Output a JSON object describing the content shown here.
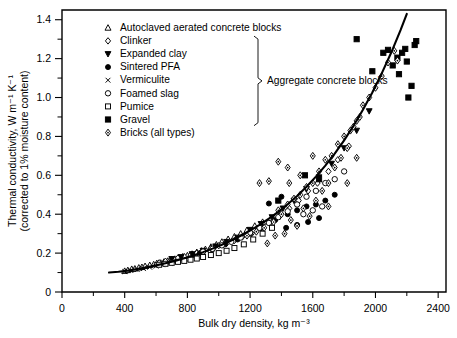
{
  "chart_data": {
    "type": "scatter",
    "title": "",
    "xlabel": "Bulk dry density, kg m⁻³",
    "ylabel": "Thermal conductivity, W m⁻¹ K⁻¹",
    "ylabel_line2": "(corrected to 1% moisture content)",
    "xlim": [
      0,
      2450
    ],
    "ylim": [
      0,
      1.45
    ],
    "x_ticks_major": [
      0,
      400,
      800,
      1200,
      1600,
      2000,
      2400
    ],
    "x_ticks_minor": [
      200,
      600,
      1000,
      1400,
      1800,
      2200
    ],
    "y_ticks_major": [
      0,
      0.2,
      0.4,
      0.6,
      0.8,
      1.0,
      1.2,
      1.4
    ],
    "y_ticks_minor": [
      0.1,
      0.3,
      0.5,
      0.7,
      0.9,
      1.1,
      1.3
    ],
    "x_tick_labels": [
      "0",
      "400",
      "800",
      "1200",
      "1600",
      "2000",
      "2400"
    ],
    "y_tick_labels": [
      "0",
      "0.2",
      "0.4",
      "0.6",
      "0.8",
      "1.0",
      "1.2",
      "1.4"
    ],
    "grid": false,
    "legend_position": "top-left-inside",
    "group_bracket_label": "Aggregate concrete blocks",
    "fit_curve": {
      "name": "best-fit trend line",
      "points": [
        [
          300,
          0.1
        ],
        [
          360,
          0.104
        ],
        [
          420,
          0.11
        ],
        [
          480,
          0.118
        ],
        [
          540,
          0.127
        ],
        [
          600,
          0.137
        ],
        [
          660,
          0.148
        ],
        [
          720,
          0.16
        ],
        [
          780,
          0.174
        ],
        [
          840,
          0.189
        ],
        [
          900,
          0.205
        ],
        [
          960,
          0.223
        ],
        [
          1020,
          0.243
        ],
        [
          1080,
          0.265
        ],
        [
          1140,
          0.289
        ],
        [
          1200,
          0.316
        ],
        [
          1260,
          0.345
        ],
        [
          1320,
          0.377
        ],
        [
          1380,
          0.412
        ],
        [
          1440,
          0.451
        ],
        [
          1500,
          0.494
        ],
        [
          1560,
          0.541
        ],
        [
          1620,
          0.593
        ],
        [
          1680,
          0.65
        ],
        [
          1740,
          0.712
        ],
        [
          1800,
          0.78
        ],
        [
          1860,
          0.855
        ],
        [
          1920,
          0.937
        ],
        [
          1980,
          1.026
        ],
        [
          2040,
          1.124
        ],
        [
          2100,
          1.23
        ],
        [
          2160,
          1.346
        ],
        [
          2200,
          1.43
        ]
      ]
    },
    "series": [
      {
        "name": "Autoclaved aerated concrete blocks",
        "marker": "triangle-open",
        "filled": false,
        "points": [
          [
            400,
            0.108
          ],
          [
            420,
            0.112
          ],
          [
            445,
            0.118
          ],
          [
            465,
            0.12
          ],
          [
            490,
            0.125
          ],
          [
            510,
            0.128
          ],
          [
            530,
            0.133
          ],
          [
            560,
            0.138
          ],
          [
            585,
            0.142
          ],
          [
            605,
            0.148
          ],
          [
            630,
            0.15
          ],
          [
            650,
            0.155
          ],
          [
            675,
            0.16
          ],
          [
            700,
            0.165
          ],
          [
            720,
            0.17
          ],
          [
            745,
            0.175
          ],
          [
            770,
            0.182
          ],
          [
            800,
            0.188
          ],
          [
            830,
            0.196
          ],
          [
            860,
            0.205
          ],
          [
            890,
            0.212
          ],
          [
            915,
            0.22
          ],
          [
            950,
            0.232
          ],
          [
            985,
            0.244
          ],
          [
            1020,
            0.258
          ],
          [
            1060,
            0.272
          ],
          [
            1100,
            0.285
          ],
          [
            1140,
            0.3
          ],
          [
            1180,
            0.318
          ],
          [
            1230,
            0.34
          ],
          [
            1280,
            0.36
          ]
        ]
      },
      {
        "name": "Clinker",
        "marker": "diamond-open",
        "filled": false,
        "points": [
          [
            620,
            0.15
          ],
          [
            660,
            0.158
          ],
          [
            700,
            0.168
          ],
          [
            740,
            0.175
          ],
          [
            780,
            0.182
          ],
          [
            820,
            0.19
          ],
          [
            860,
            0.2
          ],
          [
            900,
            0.21
          ],
          [
            950,
            0.225
          ],
          [
            1000,
            0.238
          ],
          [
            1050,
            0.25
          ],
          [
            1100,
            0.265
          ],
          [
            1150,
            0.283
          ],
          [
            1210,
            0.3
          ],
          [
            1270,
            0.33
          ],
          [
            1330,
            0.355
          ],
          [
            1390,
            0.39
          ],
          [
            1450,
            0.43
          ],
          [
            1510,
            0.47
          ],
          [
            1570,
            0.52
          ],
          [
            1630,
            0.56
          ],
          [
            1700,
            0.62
          ],
          [
            1760,
            0.68
          ],
          [
            1830,
            0.75
          ]
        ]
      },
      {
        "name": "Expanded clay",
        "marker": "triangle-down-filled",
        "filled": true,
        "points": [
          [
            700,
            0.17
          ],
          [
            760,
            0.18
          ],
          [
            830,
            0.195
          ],
          [
            900,
            0.212
          ],
          [
            980,
            0.235
          ],
          [
            1050,
            0.258
          ],
          [
            1120,
            0.28
          ],
          [
            1200,
            0.32
          ],
          [
            1270,
            0.35
          ],
          [
            1340,
            0.385
          ],
          [
            1410,
            0.43
          ],
          [
            1480,
            0.47
          ],
          [
            1560,
            0.53
          ],
          [
            1640,
            0.59
          ],
          [
            1720,
            0.66
          ],
          [
            1800,
            0.74
          ],
          [
            1880,
            0.83
          ],
          [
            1960,
            0.93
          ]
        ]
      },
      {
        "name": "Sintered PFA",
        "marker": "circle-filled",
        "filled": true,
        "points": [
          [
            880,
            0.2
          ],
          [
            960,
            0.22
          ],
          [
            1040,
            0.245
          ],
          [
            1120,
            0.27
          ],
          [
            1200,
            0.3
          ],
          [
            1280,
            0.33
          ],
          [
            1360,
            0.37
          ],
          [
            1440,
            0.4
          ],
          [
            1500,
            0.42
          ],
          [
            1560,
            0.44
          ],
          [
            1620,
            0.45
          ],
          [
            1680,
            0.47
          ],
          [
            1740,
            0.5
          ],
          [
            1430,
            0.33
          ],
          [
            1500,
            0.345
          ],
          [
            1570,
            0.36
          ],
          [
            1640,
            0.38
          ],
          [
            1320,
            0.455
          ],
          [
            1400,
            0.49
          ]
        ]
      },
      {
        "name": "Vermiculite",
        "marker": "x-small",
        "filled": true,
        "points": [
          [
            400,
            0.105
          ],
          [
            440,
            0.11
          ],
          [
            480,
            0.115
          ],
          [
            520,
            0.12
          ],
          [
            560,
            0.127
          ],
          [
            600,
            0.133
          ],
          [
            640,
            0.14
          ],
          [
            690,
            0.148
          ],
          [
            740,
            0.158
          ],
          [
            790,
            0.168
          ],
          [
            840,
            0.18
          ]
        ]
      },
      {
        "name": "Foamed slag",
        "marker": "circle-open",
        "filled": false,
        "points": [
          [
            900,
            0.208
          ],
          [
            960,
            0.222
          ],
          [
            1020,
            0.24
          ],
          [
            1080,
            0.258
          ],
          [
            1140,
            0.28
          ],
          [
            1200,
            0.305
          ],
          [
            1260,
            0.33
          ],
          [
            1320,
            0.355
          ],
          [
            1380,
            0.385
          ],
          [
            1440,
            0.415
          ],
          [
            1500,
            0.45
          ],
          [
            1560,
            0.49
          ],
          [
            1620,
            0.52
          ],
          [
            1680,
            0.56
          ],
          [
            1740,
            0.58
          ],
          [
            1800,
            0.62
          ],
          [
            1540,
            0.4
          ],
          [
            1600,
            0.42
          ],
          [
            1660,
            0.44
          ]
        ]
      },
      {
        "name": "Pumice",
        "marker": "square-open",
        "filled": false,
        "points": [
          [
            620,
            0.14
          ],
          [
            660,
            0.145
          ],
          [
            700,
            0.15
          ],
          [
            740,
            0.155
          ],
          [
            780,
            0.16
          ],
          [
            820,
            0.166
          ],
          [
            860,
            0.172
          ],
          [
            900,
            0.18
          ],
          [
            950,
            0.19
          ],
          [
            1000,
            0.2
          ],
          [
            1050,
            0.212
          ],
          [
            1100,
            0.226
          ],
          [
            1160,
            0.245
          ],
          [
            1220,
            0.27
          ],
          [
            1280,
            0.3
          ],
          [
            1340,
            0.33
          ]
        ]
      },
      {
        "name": "Gravel",
        "marker": "square-filled",
        "filled": true,
        "points": [
          [
            1380,
            0.47
          ],
          [
            1550,
            0.6
          ],
          [
            1880,
            1.3
          ],
          [
            1980,
            1.135
          ],
          [
            2050,
            1.23
          ],
          [
            2080,
            1.245
          ],
          [
            2110,
            1.165
          ],
          [
            2140,
            1.205
          ],
          [
            2150,
            1.12
          ],
          [
            2170,
            1.23
          ],
          [
            2190,
            1.25
          ],
          [
            2200,
            1.185
          ],
          [
            2210,
            1.0
          ],
          [
            2230,
            1.06
          ],
          [
            2250,
            1.27
          ],
          [
            2260,
            1.29
          ],
          [
            1640,
            0.58
          ]
        ]
      },
      {
        "name": "Bricks (all types)",
        "marker": "diamond-thin-open",
        "filled": false,
        "points": [
          [
            1180,
            0.29
          ],
          [
            1240,
            0.31
          ],
          [
            1290,
            0.33
          ],
          [
            1310,
            0.25
          ],
          [
            1350,
            0.36
          ],
          [
            1360,
            0.29
          ],
          [
            1380,
            0.42
          ],
          [
            1400,
            0.4
          ],
          [
            1420,
            0.3
          ],
          [
            1440,
            0.45
          ],
          [
            1460,
            0.37
          ],
          [
            1480,
            0.48
          ],
          [
            1500,
            0.34
          ],
          [
            1520,
            0.5
          ],
          [
            1540,
            0.43
          ],
          [
            1560,
            0.54
          ],
          [
            1580,
            0.39
          ],
          [
            1600,
            0.56
          ],
          [
            1620,
            0.47
          ],
          [
            1640,
            0.62
          ],
          [
            1660,
            0.52
          ],
          [
            1680,
            0.68
          ],
          [
            1700,
            0.56
          ],
          [
            1720,
            0.7
          ],
          [
            1740,
            0.64
          ],
          [
            1760,
            0.76
          ],
          [
            1780,
            0.69
          ],
          [
            1800,
            0.8
          ],
          [
            1820,
            0.74
          ],
          [
            1840,
            0.83
          ],
          [
            1860,
            0.85
          ],
          [
            1880,
            0.88
          ],
          [
            1900,
            0.9
          ],
          [
            1920,
            0.96
          ],
          [
            1960,
            1.0
          ],
          [
            2000,
            1.05
          ],
          [
            2040,
            1.11
          ],
          [
            2080,
            1.18
          ],
          [
            2120,
            1.24
          ],
          [
            2140,
            1.19
          ],
          [
            1450,
            0.56
          ],
          [
            1520,
            0.6
          ],
          [
            1600,
            0.7
          ],
          [
            1700,
            0.44
          ],
          [
            1820,
            0.56
          ],
          [
            1880,
            0.69
          ],
          [
            1260,
            0.56
          ],
          [
            1320,
            0.57
          ],
          [
            1440,
            0.64
          ],
          [
            1380,
            0.67
          ]
        ]
      }
    ]
  },
  "legend": {
    "items": [
      {
        "label": "Autoclaved aerated concrete blocks",
        "marker": "triangle-open"
      },
      {
        "label": "Clinker",
        "marker": "diamond-open"
      },
      {
        "label": "Expanded clay",
        "marker": "triangle-down-filled"
      },
      {
        "label": "Sintered PFA",
        "marker": "circle-filled"
      },
      {
        "label": "Vermiculite",
        "marker": "x-small"
      },
      {
        "label": "Foamed slag",
        "marker": "circle-open"
      },
      {
        "label": "Pumice",
        "marker": "square-open"
      },
      {
        "label": "Gravel",
        "marker": "square-filled"
      },
      {
        "label": "Bricks (all types)",
        "marker": "diamond-thin-open"
      }
    ],
    "bracket_label": "Aggregate concrete blocks",
    "bracket_from_index": 1,
    "bracket_to_index": 7
  },
  "colors": {
    "axis": "#000000",
    "curve": "#000000",
    "background": "#ffffff",
    "marker_open_fill": "#ffffff",
    "marker_filled": "#000000"
  }
}
